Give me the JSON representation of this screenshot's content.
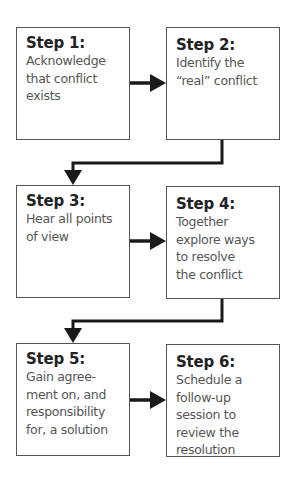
{
  "diagram": {
    "type": "flowchart",
    "steps": [
      {
        "id": 1,
        "title": "Step 1:",
        "text": "Acknowledge\nthat conflict\nexists"
      },
      {
        "id": 2,
        "title": "Step 2:",
        "text": "Identify the\n“real” conflict"
      },
      {
        "id": 3,
        "title": "Step 3:",
        "text": "Hear all points\nof view"
      },
      {
        "id": 4,
        "title": "Step 4:",
        "text": "Together\nexplore ways\nto resolve\nthe conflict"
      },
      {
        "id": 5,
        "title": "Step 5:",
        "text": "Gain agree-\nment on, and\nresponsibility\nfor, a solution"
      },
      {
        "id": 6,
        "title": "Step 6:",
        "text": "Schedule a\nfollow-up\nsession to\nreview the\nresolution"
      }
    ],
    "connections": [
      {
        "from": 1,
        "to": 2,
        "style": "straight-arrow"
      },
      {
        "from": 2,
        "to": 3,
        "style": "elbow-arrow"
      },
      {
        "from": 3,
        "to": 4,
        "style": "straight-arrow"
      },
      {
        "from": 4,
        "to": 5,
        "style": "elbow-arrow"
      },
      {
        "from": 5,
        "to": 6,
        "style": "straight-arrow"
      }
    ],
    "colors": {
      "box_border": "#555555",
      "title_text": "#222222",
      "body_text": "#555555",
      "arrow": "#1a1a1a",
      "background": "#ffffff"
    }
  }
}
